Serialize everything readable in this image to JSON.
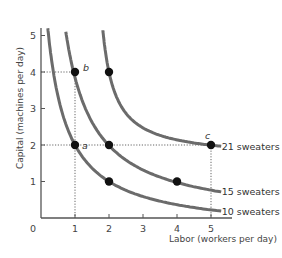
{
  "chart_data": {
    "type": "line",
    "title": "",
    "xlabel": "Labor (workers per day)",
    "ylabel": "Capital (machines per day)",
    "xlim": [
      0,
      5.3
    ],
    "ylim": [
      0,
      5.3
    ],
    "x_ticks": [
      0,
      1,
      2,
      3,
      4,
      5
    ],
    "y_ticks": [
      1,
      2,
      3,
      4,
      5
    ],
    "x_tick_labels": [
      "0",
      "1",
      "2",
      "3",
      "4",
      "5"
    ],
    "y_tick_labels": [
      "1",
      "2",
      "3",
      "4",
      "5"
    ],
    "grid": false,
    "legend": "inline labels at right end of each curve",
    "series": [
      {
        "name": "10 sweaters",
        "label": "10 sweaters",
        "shape": {
          "a": -0.4,
          "b": -0.4,
          "c": 3.36
        },
        "l_range": [
          0.2,
          5.3
        ],
        "points": [
          {
            "x": 1,
            "y": 2
          },
          {
            "x": 2,
            "y": 1
          }
        ]
      },
      {
        "name": "15 sweaters",
        "label": "15 sweaters",
        "shape": {
          "a": -0.12,
          "b": -0.1,
          "c": 4.42
        },
        "l_range": [
          0.73,
          5.3
        ],
        "points": [
          {
            "x": 1,
            "y": 4
          },
          {
            "x": 2,
            "y": 2
          },
          {
            "x": 4,
            "y": 1
          }
        ]
      },
      {
        "name": "21 sweaters",
        "label": "21 sweaters",
        "shape": {
          "a": 1.45,
          "b": 1.63,
          "c": 1.3
        },
        "l_range": [
          1.82,
          5.3
        ],
        "points": [
          {
            "x": 2,
            "y": 4
          },
          {
            "x": 5,
            "y": 2
          }
        ]
      }
    ],
    "annotations": [
      {
        "text": "a",
        "x": 1,
        "y": 2
      },
      {
        "text": "b",
        "x": 1,
        "y": 4
      },
      {
        "text": "c",
        "x": 5,
        "y": 2
      }
    ],
    "reference_lines": [
      {
        "from": [
          0,
          4
        ],
        "to": [
          1,
          4
        ]
      },
      {
        "from": [
          1,
          4
        ],
        "to": [
          1,
          0
        ]
      },
      {
        "from": [
          0,
          2
        ],
        "to": [
          5,
          2
        ]
      },
      {
        "from": [
          5,
          2
        ],
        "to": [
          5,
          0
        ]
      }
    ]
  },
  "colors": {
    "curve": "#6b6b6b",
    "axis": "#555555",
    "dot": "#111111",
    "dotted": "#555555"
  }
}
